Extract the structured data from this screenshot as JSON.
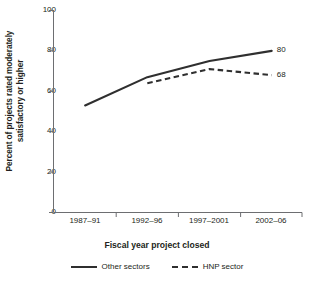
{
  "chart_data": {
    "type": "line",
    "title": "",
    "xlabel": "Fiscal year project closed",
    "ylabel": "Percent of projects rated moderately satisfactory or higher",
    "ylabel_lines": [
      "Percent of projects rated moderately",
      "satisfactory or higher"
    ],
    "categories": [
      "1987–91",
      "1992–96",
      "1997–2001",
      "2002–06"
    ],
    "ylim": [
      0,
      100
    ],
    "yticks": [
      0,
      20,
      40,
      60,
      80,
      100
    ],
    "ytick_labels": [
      "0",
      "20",
      "40",
      "60",
      "80",
      "100"
    ],
    "grid": false,
    "legend_position": "bottom",
    "series": [
      {
        "name": "Other sectors",
        "style": "solid",
        "color": "#2f2f2f",
        "values": [
          53,
          67,
          75,
          80
        ],
        "end_label": "80"
      },
      {
        "name": "HNP sector",
        "style": "dashed",
        "color": "#2f2f2f",
        "values": [
          null,
          64,
          71,
          68
        ],
        "end_label": "68"
      }
    ]
  },
  "axis": {
    "ytick_0": "0",
    "ytick_20": "20",
    "ytick_40": "40",
    "ytick_60": "60",
    "ytick_80": "80",
    "ytick_100": "100",
    "xtick_0": "1987–91",
    "xtick_1": "1992–96",
    "xtick_2": "1997–2001",
    "xtick_3": "2002–06",
    "xtitle": "Fiscal year project closed",
    "ytitle_line1": "Percent of projects rated moderately",
    "ytitle_line2": "satisfactory or higher"
  },
  "legend": {
    "item1": "Other sectors",
    "item2": "HNP sector"
  },
  "annotations": {
    "other_sectors_end": "80",
    "hnp_sector_end": "68"
  }
}
